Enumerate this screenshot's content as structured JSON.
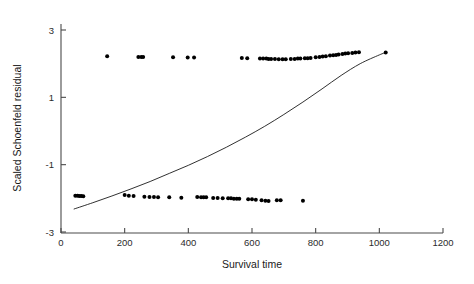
{
  "chart_data": {
    "type": "scatter",
    "title": "",
    "subtitle": "",
    "xlabel": "Survival time",
    "ylabel": "Scaled Schoenfeld residual",
    "xlim": [
      0,
      1200
    ],
    "ylim": [
      -3,
      3
    ],
    "xticks": [
      0,
      200,
      400,
      600,
      800,
      1000,
      1200
    ],
    "xticklabels": [
      "0",
      "200",
      "400",
      "600",
      "800",
      "1000",
      "1200"
    ],
    "yticks": [
      3,
      1,
      -1,
      -3
    ],
    "yticklabels": [
      "3",
      "1",
      "-1",
      "-3"
    ],
    "grid": false,
    "legend": null,
    "marker": "filled-circle",
    "marker_color": "#000000",
    "series": [
      {
        "name": "Scaled Schoenfeld residuals",
        "points": [
          [
            45,
            -1.92
          ],
          [
            52,
            -1.92
          ],
          [
            58,
            -1.93
          ],
          [
            64,
            -1.93
          ],
          [
            70,
            -1.94
          ],
          [
            145,
            2.22
          ],
          [
            200,
            -1.9
          ],
          [
            213,
            -1.92
          ],
          [
            228,
            -1.93
          ],
          [
            243,
            2.2
          ],
          [
            252,
            2.2
          ],
          [
            258,
            2.2
          ],
          [
            262,
            -1.95
          ],
          [
            278,
            -1.96
          ],
          [
            292,
            -1.96
          ],
          [
            305,
            -1.97
          ],
          [
            340,
            -1.97
          ],
          [
            352,
            2.19
          ],
          [
            378,
            -1.98
          ],
          [
            398,
            2.18
          ],
          [
            418,
            2.18
          ],
          [
            428,
            -1.96
          ],
          [
            440,
            -1.97
          ],
          [
            448,
            -1.97
          ],
          [
            456,
            -1.97
          ],
          [
            478,
            -1.99
          ],
          [
            492,
            -1.99
          ],
          [
            508,
            -2.0
          ],
          [
            525,
            -2.0
          ],
          [
            534,
            -2.0
          ],
          [
            543,
            -2.01
          ],
          [
            552,
            -2.01
          ],
          [
            560,
            -2.01
          ],
          [
            568,
            2.17
          ],
          [
            585,
            2.16
          ],
          [
            588,
            -2.03
          ],
          [
            600,
            -2.03
          ],
          [
            612,
            -2.04
          ],
          [
            625,
            2.15
          ],
          [
            635,
            2.15
          ],
          [
            645,
            2.15
          ],
          [
            652,
            2.14
          ],
          [
            660,
            2.14
          ],
          [
            630,
            -2.06
          ],
          [
            642,
            -2.07
          ],
          [
            652,
            -2.08
          ],
          [
            672,
            2.14
          ],
          [
            684,
            2.13
          ],
          [
            696,
            2.13
          ],
          [
            706,
            2.13
          ],
          [
            678,
            -2.06
          ],
          [
            690,
            -2.06
          ],
          [
            722,
            2.14
          ],
          [
            734,
            2.14
          ],
          [
            744,
            2.15
          ],
          [
            752,
            2.15
          ],
          [
            760,
            -2.07
          ],
          [
            766,
            2.16
          ],
          [
            775,
            2.16
          ],
          [
            784,
            2.17
          ],
          [
            800,
            2.19
          ],
          [
            812,
            2.2
          ],
          [
            822,
            2.21
          ],
          [
            832,
            2.22
          ],
          [
            845,
            2.24
          ],
          [
            855,
            2.25
          ],
          [
            864,
            2.26
          ],
          [
            872,
            2.27
          ],
          [
            884,
            2.29
          ],
          [
            893,
            2.3
          ],
          [
            902,
            2.31
          ],
          [
            915,
            2.32
          ],
          [
            925,
            2.33
          ],
          [
            936,
            2.34
          ],
          [
            1020,
            2.33
          ]
        ]
      }
    ],
    "fit_line": {
      "name": "smoothed fit",
      "style": "solid",
      "color": "#1a1a1a",
      "points": [
        [
          40,
          -2.32
        ],
        [
          100,
          -2.13
        ],
        [
          160,
          -1.93
        ],
        [
          220,
          -1.72
        ],
        [
          280,
          -1.5
        ],
        [
          340,
          -1.26
        ],
        [
          400,
          -1.02
        ],
        [
          460,
          -0.76
        ],
        [
          520,
          -0.48
        ],
        [
          580,
          -0.18
        ],
        [
          640,
          0.14
        ],
        [
          700,
          0.49
        ],
        [
          760,
          0.86
        ],
        [
          820,
          1.25
        ],
        [
          880,
          1.65
        ],
        [
          940,
          2.0
        ],
        [
          1000,
          2.26
        ],
        [
          1020,
          2.33
        ]
      ]
    }
  }
}
